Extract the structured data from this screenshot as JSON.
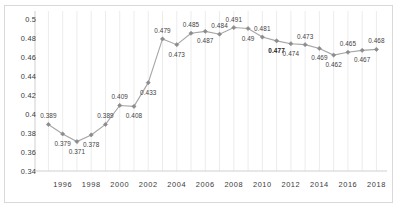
{
  "chart_data": {
    "type": "line",
    "title": "",
    "subtitle": "",
    "xlabel": "",
    "ylabel": "",
    "x": [
      1995,
      1996,
      1997,
      1998,
      1999,
      2000,
      2001,
      2002,
      2003,
      2004,
      2005,
      2006,
      2007,
      2008,
      2009,
      2010,
      2011,
      2012,
      2013,
      2014,
      2015,
      2016,
      2017,
      2018
    ],
    "values": [
      0.389,
      0.379,
      0.371,
      0.378,
      0.389,
      0.409,
      0.408,
      0.433,
      0.479,
      0.473,
      0.485,
      0.487,
      0.484,
      0.491,
      0.49,
      0.481,
      0.477,
      0.474,
      0.473,
      0.469,
      0.462,
      0.465,
      0.467,
      0.468
    ],
    "data_labels": [
      "0.389",
      "0.379",
      "0.371",
      "0.378",
      "0.389",
      "0.409",
      "0.408",
      "0.433",
      "0.479",
      "0.473",
      "0.485",
      "0.487",
      "0.484",
      "0.491",
      "0.49",
      "0.481",
      "0.477",
      "0.474",
      "0.473",
      "0.469",
      "0.462",
      "0.465",
      "0.467",
      "0.468"
    ],
    "bold_label_index": 16,
    "ylim": [
      0.34,
      0.5
    ],
    "ytick_labels": [
      "0.5",
      "0.48",
      "0.46",
      "0.44",
      "0.42",
      "0.4",
      "0.38",
      "0.36",
      "0.34"
    ],
    "ytick_values": [
      0.5,
      0.48,
      0.46,
      0.44,
      0.42,
      0.4,
      0.38,
      0.36,
      0.34
    ],
    "xtick_labels": [
      "1996",
      "1998",
      "2000",
      "2002",
      "2004",
      "2006",
      "2008",
      "2010",
      "2012",
      "2014",
      "2016",
      "2018"
    ],
    "xtick_values": [
      1996,
      1998,
      2000,
      2002,
      2004,
      2006,
      2008,
      2010,
      2012,
      2014,
      2016,
      2018
    ],
    "xlim": [
      1994.2,
      2018.6
    ],
    "grid": {
      "vertical": true,
      "horizontal": false
    },
    "legend": {
      "visible": false,
      "position": "none"
    },
    "series_color": "#a6a6a6",
    "marker_color": "#8c8c8c",
    "gridline_color": "#ececec",
    "axis_color": "#cfcfcf",
    "border_color": "#d9d9d9",
    "label_color": "#3f3f3f",
    "marker": "diamond"
  }
}
